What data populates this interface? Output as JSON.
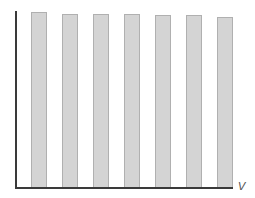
{
  "chart_data": {
    "type": "bar",
    "title": "",
    "xlabel": "V",
    "ylabel": "",
    "categories": [
      "1",
      "2",
      "3",
      "4",
      "5",
      "6",
      "7"
    ],
    "values": [
      100,
      99,
      99,
      99,
      98,
      98,
      97
    ],
    "ylim": [
      0,
      100
    ],
    "grid": false,
    "legend": null,
    "colors": {
      "bar_fill": "#d4d4d4",
      "bar_border": "#b0b0b0",
      "axis": "#3a3a3a"
    }
  }
}
